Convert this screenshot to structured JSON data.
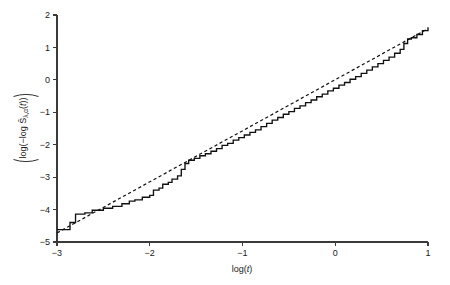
{
  "chart_data": {
    "type": "line",
    "title": "",
    "subtitle": "",
    "xlabel": "log(t)",
    "xlabel_parts": {
      "prefix": "log(",
      "italic": "t",
      "suffix": ")"
    },
    "ylabel": "log(−log Ŝλ,α(t))",
    "ylabel_parts": {
      "open": "log(",
      "neg": "−log ",
      "shat": "Ŝ",
      "sub": "λ,α",
      "arg_open": "(",
      "arg": "t",
      "arg_close": ")",
      "close": ")"
    },
    "xlim": [
      -3,
      1
    ],
    "ylim": [
      -5,
      2
    ],
    "xticks": [
      -3,
      -2,
      -1,
      0,
      1
    ],
    "xtick_labels": [
      "−3",
      "−2",
      "−1",
      "0",
      "1"
    ],
    "yticks": [
      -5,
      -4,
      -3,
      -2,
      -1,
      0,
      1,
      2
    ],
    "ytick_labels": [
      "−5",
      "−4",
      "−3",
      "−2",
      "−1",
      "0",
      "1",
      "2"
    ],
    "grid": false,
    "legend": null,
    "legend_position": "none",
    "axis_style": "L-shaped spine, ticks pointing outward",
    "colors": {
      "series": "#101010",
      "axis": "#3a3a3a",
      "background": "#ffffff"
    },
    "series": [
      {
        "name": "empirical log(-log S-hat) step function",
        "style": "solid step",
        "linestyle": "solid",
        "color": "#101010",
        "step": true,
        "points": [
          [
            -3.0,
            -4.62
          ],
          [
            -2.86,
            -4.62
          ],
          [
            -2.86,
            -4.4
          ],
          [
            -2.8,
            -4.4
          ],
          [
            -2.8,
            -4.14
          ],
          [
            -2.7,
            -4.14
          ],
          [
            -2.7,
            -4.1
          ],
          [
            -2.62,
            -4.1
          ],
          [
            -2.62,
            -4.02
          ],
          [
            -2.5,
            -4.02
          ],
          [
            -2.5,
            -3.96
          ],
          [
            -2.4,
            -3.96
          ],
          [
            -2.4,
            -3.9
          ],
          [
            -2.3,
            -3.9
          ],
          [
            -2.3,
            -3.82
          ],
          [
            -2.22,
            -3.82
          ],
          [
            -2.22,
            -3.74
          ],
          [
            -2.16,
            -3.74
          ],
          [
            -2.16,
            -3.7
          ],
          [
            -2.08,
            -3.7
          ],
          [
            -2.08,
            -3.62
          ],
          [
            -2.0,
            -3.62
          ],
          [
            -2.0,
            -3.56
          ],
          [
            -1.96,
            -3.56
          ],
          [
            -1.96,
            -3.4
          ],
          [
            -1.9,
            -3.4
          ],
          [
            -1.9,
            -3.34
          ],
          [
            -1.86,
            -3.34
          ],
          [
            -1.86,
            -3.22
          ],
          [
            -1.8,
            -3.22
          ],
          [
            -1.8,
            -3.16
          ],
          [
            -1.76,
            -3.16
          ],
          [
            -1.76,
            -3.06
          ],
          [
            -1.7,
            -3.06
          ],
          [
            -1.7,
            -2.96
          ],
          [
            -1.66,
            -2.96
          ],
          [
            -1.66,
            -2.76
          ],
          [
            -1.62,
            -2.76
          ],
          [
            -1.62,
            -2.58
          ],
          [
            -1.58,
            -2.58
          ],
          [
            -1.58,
            -2.48
          ],
          [
            -1.52,
            -2.48
          ],
          [
            -1.52,
            -2.42
          ],
          [
            -1.46,
            -2.42
          ],
          [
            -1.46,
            -2.34
          ],
          [
            -1.4,
            -2.34
          ],
          [
            -1.4,
            -2.28
          ],
          [
            -1.34,
            -2.28
          ],
          [
            -1.34,
            -2.2
          ],
          [
            -1.28,
            -2.2
          ],
          [
            -1.28,
            -2.12
          ],
          [
            -1.22,
            -2.12
          ],
          [
            -1.22,
            -2.02
          ],
          [
            -1.16,
            -2.02
          ],
          [
            -1.16,
            -1.96
          ],
          [
            -1.1,
            -1.96
          ],
          [
            -1.1,
            -1.86
          ],
          [
            -1.04,
            -1.86
          ],
          [
            -1.04,
            -1.78
          ],
          [
            -0.98,
            -1.78
          ],
          [
            -0.98,
            -1.7
          ],
          [
            -0.92,
            -1.7
          ],
          [
            -0.92,
            -1.62
          ],
          [
            -0.86,
            -1.62
          ],
          [
            -0.86,
            -1.54
          ],
          [
            -0.8,
            -1.54
          ],
          [
            -0.8,
            -1.44
          ],
          [
            -0.74,
            -1.44
          ],
          [
            -0.74,
            -1.34
          ],
          [
            -0.68,
            -1.34
          ],
          [
            -0.68,
            -1.24
          ],
          [
            -0.62,
            -1.24
          ],
          [
            -0.62,
            -1.16
          ],
          [
            -0.56,
            -1.16
          ],
          [
            -0.56,
            -1.06
          ],
          [
            -0.5,
            -1.06
          ],
          [
            -0.5,
            -0.98
          ],
          [
            -0.44,
            -0.98
          ],
          [
            -0.44,
            -0.88
          ],
          [
            -0.38,
            -0.88
          ],
          [
            -0.38,
            -0.8
          ],
          [
            -0.32,
            -0.8
          ],
          [
            -0.32,
            -0.7
          ],
          [
            -0.26,
            -0.7
          ],
          [
            -0.26,
            -0.62
          ],
          [
            -0.2,
            -0.62
          ],
          [
            -0.2,
            -0.52
          ],
          [
            -0.14,
            -0.52
          ],
          [
            -0.14,
            -0.44
          ],
          [
            -0.08,
            -0.44
          ],
          [
            -0.08,
            -0.34
          ],
          [
            -0.02,
            -0.34
          ],
          [
            -0.02,
            -0.26
          ],
          [
            0.04,
            -0.26
          ],
          [
            0.04,
            -0.16
          ],
          [
            0.1,
            -0.16
          ],
          [
            0.1,
            -0.08
          ],
          [
            0.16,
            -0.08
          ],
          [
            0.16,
            0.02
          ],
          [
            0.22,
            0.02
          ],
          [
            0.22,
            0.1
          ],
          [
            0.28,
            0.1
          ],
          [
            0.28,
            0.2
          ],
          [
            0.34,
            0.2
          ],
          [
            0.34,
            0.3
          ],
          [
            0.4,
            0.3
          ],
          [
            0.4,
            0.4
          ],
          [
            0.46,
            0.4
          ],
          [
            0.46,
            0.5
          ],
          [
            0.52,
            0.5
          ],
          [
            0.52,
            0.6
          ],
          [
            0.58,
            0.6
          ],
          [
            0.58,
            0.7
          ],
          [
            0.64,
            0.7
          ],
          [
            0.64,
            0.82
          ],
          [
            0.7,
            0.82
          ],
          [
            0.7,
            0.94
          ],
          [
            0.74,
            0.94
          ],
          [
            0.74,
            1.12
          ],
          [
            0.78,
            1.12
          ],
          [
            0.78,
            1.26
          ],
          [
            0.82,
            1.26
          ],
          [
            0.82,
            1.3
          ],
          [
            0.88,
            1.3
          ],
          [
            0.88,
            1.4
          ],
          [
            0.94,
            1.4
          ],
          [
            0.94,
            1.52
          ],
          [
            1.0,
            1.52
          ],
          [
            1.0,
            1.62
          ]
        ]
      },
      {
        "name": "fitted straight reference line",
        "style": "dashed straight line",
        "linestyle": "dashed",
        "color": "#101010",
        "step": false,
        "points": [
          [
            -3.0,
            -4.72
          ],
          [
            1.0,
            1.58
          ]
        ],
        "slope": 1.575,
        "intercept": 0.005
      }
    ]
  },
  "figure": {
    "background": "#ffffff",
    "width": 450,
    "height": 285
  }
}
